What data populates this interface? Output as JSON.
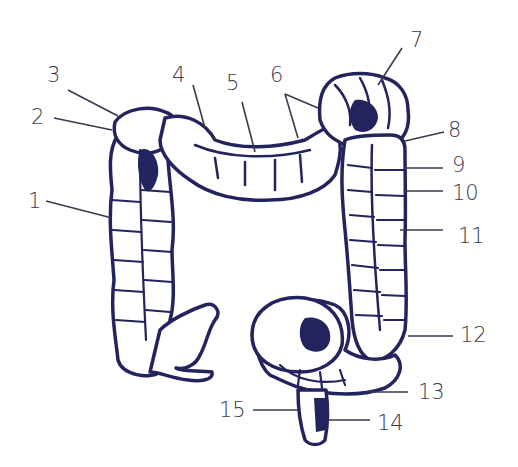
{
  "diagram": {
    "colors": {
      "outline": "#23235e",
      "leader": "#3a3a50",
      "label": "#3a3a50",
      "background": "#ffffff"
    },
    "labels": [
      {
        "id": "1",
        "text": "1",
        "x": 28,
        "y": 191
      },
      {
        "id": "2",
        "text": "2",
        "x": 31,
        "y": 107
      },
      {
        "id": "3",
        "text": "3",
        "x": 47,
        "y": 65
      },
      {
        "id": "4",
        "text": "4",
        "x": 172,
        "y": 65
      },
      {
        "id": "5",
        "text": "5",
        "x": 226,
        "y": 73
      },
      {
        "id": "6",
        "text": "6",
        "x": 270,
        "y": 65
      },
      {
        "id": "7",
        "text": "7",
        "x": 410,
        "y": 30
      },
      {
        "id": "8",
        "text": "8",
        "x": 448,
        "y": 120
      },
      {
        "id": "9",
        "text": "9",
        "x": 452,
        "y": 155
      },
      {
        "id": "10",
        "text": "10",
        "x": 452,
        "y": 183
      },
      {
        "id": "11",
        "text": "11",
        "x": 458,
        "y": 226
      },
      {
        "id": "12",
        "text": "12",
        "x": 460,
        "y": 325
      },
      {
        "id": "13",
        "text": "13",
        "x": 418,
        "y": 382
      },
      {
        "id": "14",
        "text": "14",
        "x": 377,
        "y": 413
      },
      {
        "id": "15",
        "text": "15",
        "x": 219,
        "y": 400
      }
    ]
  }
}
